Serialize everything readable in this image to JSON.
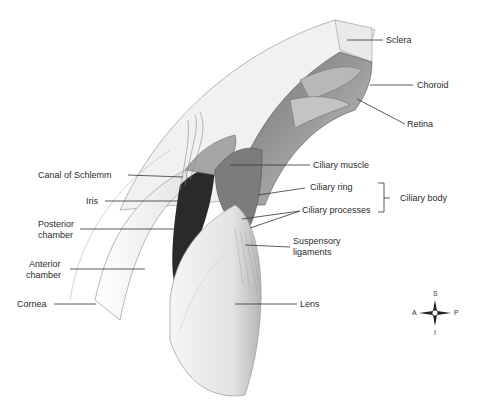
{
  "diagram": {
    "labels": {
      "sclera": "Sclera",
      "choroid": "Choroid",
      "retina": "Retina",
      "canal_of_schlemm": "Canal of Schlemm",
      "iris": "Iris",
      "posterior_chamber_1": "Posterior",
      "posterior_chamber_2": "chamber",
      "anterior_chamber_1": "Anterior",
      "anterior_chamber_2": "chamber",
      "cornea": "Cornea",
      "ciliary_muscle": "Ciliary muscle",
      "ciliary_ring": "Ciliary ring",
      "ciliary_processes": "Ciliary processes",
      "ciliary_body": "Ciliary body",
      "suspensory_1": "Suspensory",
      "suspensory_2": "ligaments",
      "lens": "Lens"
    },
    "compass": {
      "superior": "S",
      "inferior": "I",
      "anterior": "A",
      "posterior": "P"
    },
    "colors": {
      "line": "#333333",
      "dark_tissue": "#2a2a2a",
      "mid_tissue": "#8a8a8a",
      "light_tissue": "#e6e6e6"
    }
  }
}
